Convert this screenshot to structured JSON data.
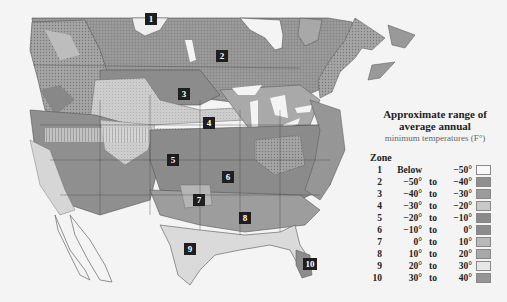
{
  "legend": {
    "title_line1": "Approximate range of",
    "title_line2": "average annual",
    "title_line3": "minimum temperatures (F°)",
    "zone_header": "Zone",
    "zones": [
      {
        "zone": "1",
        "from": "Below",
        "to": "",
        "upper": "−50°",
        "color": "#f4f4f4"
      },
      {
        "zone": "2",
        "from": "−50°",
        "to": "to",
        "upper": "−40°",
        "color": "#8f8f8f"
      },
      {
        "zone": "3",
        "from": "−40°",
        "to": "to",
        "upper": "−30°",
        "color": "#9a9a9a"
      },
      {
        "zone": "4",
        "from": "−30°",
        "to": "to",
        "upper": "−20°",
        "color": "#c8c8c8"
      },
      {
        "zone": "5",
        "from": "−20°",
        "to": "to",
        "upper": "−10°",
        "color": "#8a8a8a"
      },
      {
        "zone": "6",
        "from": "−10°",
        "to": "to",
        "upper": "0°",
        "color": "#8c8c8c"
      },
      {
        "zone": "7",
        "from": "0°",
        "to": "to",
        "upper": "10°",
        "color": "#b8b8b8"
      },
      {
        "zone": "8",
        "from": "10°",
        "to": "to",
        "upper": "20°",
        "color": "#a8a8a8"
      },
      {
        "zone": "9",
        "from": "20°",
        "to": "to",
        "upper": "30°",
        "color": "#e0e0e0"
      },
      {
        "zone": "10",
        "from": "30°",
        "to": "to",
        "upper": "40°",
        "color": "#959595"
      }
    ]
  },
  "map": {
    "zone_labels": [
      {
        "label": "1",
        "x": 145,
        "y": 13
      },
      {
        "label": "2",
        "x": 216,
        "y": 50
      },
      {
        "label": "3",
        "x": 178,
        "y": 88
      },
      {
        "label": "4",
        "x": 203,
        "y": 117
      },
      {
        "label": "5",
        "x": 167,
        "y": 154
      },
      {
        "label": "6",
        "x": 222,
        "y": 171
      },
      {
        "label": "7",
        "x": 193,
        "y": 194
      },
      {
        "label": "8",
        "x": 239,
        "y": 212
      },
      {
        "label": "9",
        "x": 184,
        "y": 243
      },
      {
        "label": "10",
        "x": 304,
        "y": 258
      }
    ]
  }
}
